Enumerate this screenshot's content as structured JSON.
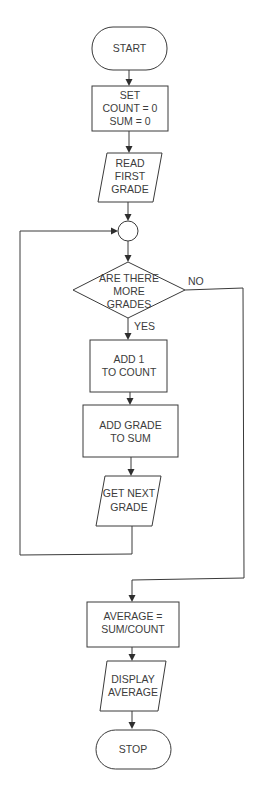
{
  "diagram": {
    "type": "flowchart",
    "nodes": {
      "start": {
        "shape": "terminator",
        "lines": [
          "START"
        ]
      },
      "init": {
        "shape": "process",
        "lines": [
          "SET",
          "COUNT = 0",
          "SUM = 0"
        ]
      },
      "read_first": {
        "shape": "input-output",
        "lines": [
          "READ",
          "FIRST",
          "GRADE"
        ]
      },
      "connector": {
        "shape": "connector",
        "lines": []
      },
      "decision": {
        "shape": "decision",
        "lines": [
          "ARE THERE",
          "MORE",
          "GRADES"
        ]
      },
      "add_count": {
        "shape": "process",
        "lines": [
          "ADD 1",
          "TO COUNT"
        ]
      },
      "add_sum": {
        "shape": "process",
        "lines": [
          "ADD GRADE",
          "TO SUM"
        ]
      },
      "get_next": {
        "shape": "input-output",
        "lines": [
          "GET NEXT",
          "GRADE"
        ]
      },
      "average": {
        "shape": "process",
        "lines": [
          "AVERAGE =",
          "SUM/COUNT"
        ]
      },
      "display": {
        "shape": "input-output",
        "lines": [
          "DISPLAY",
          "AVERAGE"
        ]
      },
      "stop": {
        "shape": "terminator",
        "lines": [
          "STOP"
        ]
      }
    },
    "edge_labels": {
      "yes": "YES",
      "no": "NO"
    },
    "edges": [
      {
        "from": "start",
        "to": "init"
      },
      {
        "from": "init",
        "to": "read_first"
      },
      {
        "from": "read_first",
        "to": "connector"
      },
      {
        "from": "connector",
        "to": "decision"
      },
      {
        "from": "decision",
        "to": "add_count",
        "label": "YES"
      },
      {
        "from": "decision",
        "to": "average",
        "label": "NO"
      },
      {
        "from": "add_count",
        "to": "add_sum"
      },
      {
        "from": "add_sum",
        "to": "get_next"
      },
      {
        "from": "get_next",
        "to": "connector"
      },
      {
        "from": "average",
        "to": "display"
      },
      {
        "from": "display",
        "to": "stop"
      }
    ],
    "colors": {
      "stroke": "#3a3a3a",
      "text": "#3c3c3c",
      "background": "#ffffff"
    }
  }
}
